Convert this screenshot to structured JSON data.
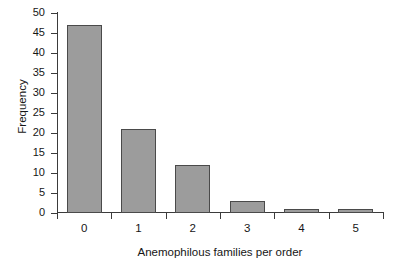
{
  "chart_data": {
    "type": "bar",
    "title": "",
    "subtitle": "",
    "xlabel": "Anemophilous families per order",
    "ylabel": "Frequency",
    "categories": [
      "0",
      "1",
      "2",
      "3",
      "4",
      "5"
    ],
    "values": [
      47,
      21,
      12,
      3,
      1,
      1
    ],
    "series": [
      {
        "name": "Frequency",
        "values": [
          47,
          21,
          12,
          3,
          1,
          1
        ]
      }
    ],
    "ylim": [
      0,
      50
    ],
    "ytick_labels": [
      "50",
      "45",
      "40",
      "35",
      "30",
      "25",
      "20",
      "15",
      "10",
      "5",
      "0"
    ],
    "ytick_values": [
      50,
      45,
      40,
      35,
      30,
      25,
      20,
      15,
      10,
      5,
      0
    ],
    "ytick_step": 5,
    "xtick_labels": [
      "0",
      "1",
      "2",
      "3",
      "4",
      "5"
    ],
    "grid": false,
    "legend": false,
    "legend_position": "none",
    "annotations": [],
    "colors": {
      "bar_fill": "#9c9c9c",
      "bar_border": "#4a4a4a",
      "axis": "#3b3b3b",
      "text": "#161616",
      "background": "#ffffff"
    }
  }
}
